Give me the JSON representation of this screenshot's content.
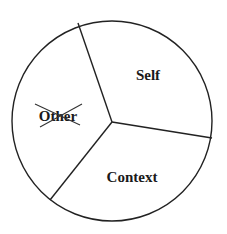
{
  "diagram": {
    "type": "pie-segmented-circle",
    "segments": [
      {
        "id": "self",
        "label": "Self",
        "crossed_out": false
      },
      {
        "id": "other",
        "label": "Other",
        "crossed_out": true
      },
      {
        "id": "context",
        "label": "Context",
        "crossed_out": false
      }
    ],
    "colors": {
      "stroke": "#222222",
      "fill": "#ffffff",
      "text": "#1a1a1a"
    }
  }
}
